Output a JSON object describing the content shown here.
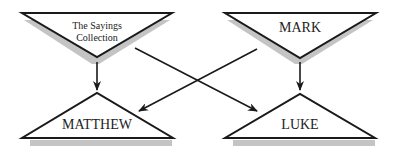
{
  "diagram": {
    "nodes": [
      {
        "id": "q",
        "label_line1": "The Sayings",
        "label_line2": "Collection",
        "shape": "inverted-triangle"
      },
      {
        "id": "mark",
        "label": "MARK",
        "shape": "inverted-triangle"
      },
      {
        "id": "matthew",
        "label": "MATTHEW",
        "shape": "triangle"
      },
      {
        "id": "luke",
        "label": "LUKE",
        "shape": "triangle"
      }
    ],
    "edges": [
      {
        "from": "The Sayings Collection",
        "to": "MATTHEW"
      },
      {
        "from": "The Sayings Collection",
        "to": "LUKE"
      },
      {
        "from": "MARK",
        "to": "MATTHEW"
      },
      {
        "from": "MARK",
        "to": "LUKE"
      }
    ],
    "colors": {
      "stroke": "#1a1a1a",
      "shadow": "#bdbdbd",
      "fill": "#ffffff"
    }
  }
}
